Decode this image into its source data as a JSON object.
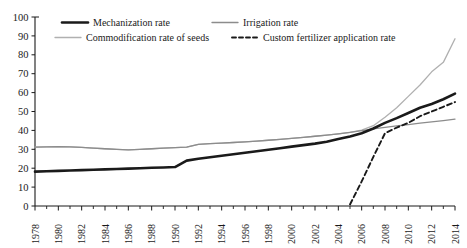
{
  "chart_data": {
    "type": "line",
    "title": "",
    "subtitle": "",
    "xlabel": "",
    "ylabel": "",
    "xlim": [
      1978,
      2014
    ],
    "ylim": [
      0,
      100
    ],
    "grid": false,
    "legend_position": "top",
    "y_ticks": [
      "0",
      "10",
      "20",
      "30",
      "40",
      "50",
      "60",
      "70",
      "80",
      "90",
      "100"
    ],
    "x_ticks": [
      "1978",
      "1980",
      "1982",
      "1984",
      "1986",
      "1988",
      "1990",
      "1992",
      "1994",
      "1996",
      "1998",
      "2000",
      "2002",
      "2004",
      "2006",
      "2008",
      "2010",
      "2012",
      "2014"
    ],
    "x": [
      1978,
      1979,
      1980,
      1981,
      1982,
      1983,
      1984,
      1985,
      1986,
      1987,
      1988,
      1989,
      1990,
      1991,
      1992,
      1993,
      1994,
      1995,
      1996,
      1997,
      1998,
      1999,
      2000,
      2001,
      2002,
      2003,
      2004,
      2005,
      2006,
      2007,
      2008,
      2009,
      2010,
      2011,
      2012,
      2013,
      2014
    ],
    "series": [
      {
        "name": "Mechanization rate",
        "color": "#1a1a1a",
        "style": "solid",
        "width": 2.6,
        "values": [
          18.2,
          18.4,
          18.6,
          18.8,
          19.0,
          19.2,
          19.4,
          19.6,
          19.8,
          20.0,
          20.2,
          20.4,
          20.6,
          24.0,
          25.0,
          25.8,
          26.6,
          27.4,
          28.2,
          29.0,
          29.8,
          30.6,
          31.4,
          32.2,
          33.0,
          34.0,
          35.5,
          36.8,
          38.5,
          41.0,
          44.0,
          46.5,
          49.2,
          52.0,
          54.0,
          56.5,
          59.5
        ]
      },
      {
        "name": "Irrigation rate",
        "color": "#8c8c8c",
        "style": "solid",
        "width": 1.3,
        "values": [
          31.2,
          31.3,
          31.4,
          31.3,
          31.0,
          30.6,
          30.3,
          30.0,
          29.7,
          30.0,
          30.3,
          30.6,
          30.9,
          31.2,
          32.6,
          33.0,
          33.3,
          33.6,
          33.9,
          34.3,
          34.8,
          35.3,
          35.8,
          36.3,
          36.9,
          37.5,
          38.2,
          39.0,
          39.9,
          40.8,
          41.6,
          42.4,
          43.1,
          43.8,
          44.5,
          45.2,
          46.0
        ]
      },
      {
        "name": "Commodification rate of seeds",
        "color": "#b0b0b0",
        "style": "solid",
        "width": 1.3,
        "values": [
          31.2,
          31.3,
          31.4,
          31.3,
          31.0,
          30.6,
          30.3,
          30.0,
          29.7,
          30.0,
          30.3,
          30.6,
          30.9,
          31.2,
          32.6,
          33.0,
          33.3,
          33.6,
          33.9,
          34.3,
          34.8,
          35.3,
          35.8,
          36.3,
          36.9,
          37.5,
          38.2,
          39.0,
          40.2,
          42.5,
          47.0,
          52.0,
          58.0,
          64.0,
          71.0,
          76.0,
          88.5
        ]
      },
      {
        "name": "Custom fertilizer application rate",
        "color": "#1a1a1a",
        "style": "dashed",
        "width": 1.9,
        "values": [
          null,
          null,
          null,
          null,
          null,
          null,
          null,
          null,
          null,
          null,
          null,
          null,
          null,
          null,
          null,
          null,
          null,
          null,
          null,
          null,
          null,
          null,
          null,
          null,
          null,
          null,
          null,
          0.8,
          13.0,
          26.0,
          38.5,
          41.5,
          44.0,
          47.5,
          50.0,
          52.5,
          55.0
        ]
      }
    ],
    "legend": [
      {
        "label": "Mechanization rate",
        "color": "#1a1a1a",
        "style": "solid",
        "width": 2.6
      },
      {
        "label": "Irrigation rate",
        "color": "#8c8c8c",
        "style": "solid",
        "width": 1.3
      },
      {
        "label": "Commodification rate of seeds",
        "color": "#b0b0b0",
        "style": "solid",
        "width": 1.3
      },
      {
        "label": "Custom fertilizer application rate",
        "color": "#1a1a1a",
        "style": "dashed",
        "width": 1.9
      }
    ]
  }
}
